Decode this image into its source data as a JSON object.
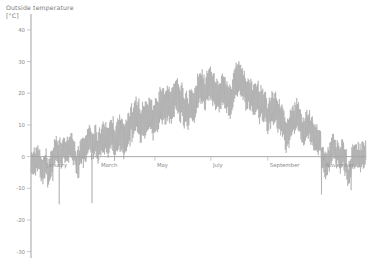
{
  "chart_data": {
    "type": "line",
    "title_line1": "Outside temperature",
    "title_line2": "[°C]",
    "xlabel": "",
    "ylabel": "Outside temperature [°C]",
    "ylim": [
      -30,
      45
    ],
    "yticks": [
      40,
      30,
      20,
      10,
      0,
      -10,
      -20,
      -30
    ],
    "ytick_labels": [
      "40",
      "30",
      "20",
      "10",
      "0",
      "-10",
      "-20",
      "-30"
    ],
    "xlim": [
      0,
      365
    ],
    "xticks": [
      15,
      74,
      135,
      196,
      258,
      319
    ],
    "xtick_labels": [
      "January",
      "March",
      "May",
      "July",
      "September",
      "November"
    ],
    "grid": false,
    "legend": null,
    "series_name": "Outside temperature",
    "series_color": "#9a9a9a",
    "axis_color": "#b0b0b0",
    "zero_line_value": 0,
    "sampling": "hourly over one calendar year",
    "annual_min": -26,
    "annual_max": 33,
    "monthly_mean": [
      -2,
      0,
      4,
      9,
      14,
      18,
      20,
      19,
      15,
      10,
      4,
      0
    ],
    "monthly_max": [
      8,
      10,
      16,
      23,
      28,
      31,
      33,
      32,
      28,
      22,
      14,
      10
    ],
    "monthly_min": [
      -18,
      -26,
      -12,
      -3,
      2,
      6,
      9,
      8,
      3,
      -2,
      -9,
      -16
    ],
    "x": [
      1,
      8,
      15,
      22,
      29,
      36,
      43,
      50,
      57,
      64,
      71,
      78,
      85,
      92,
      99,
      106,
      113,
      120,
      127,
      134,
      141,
      148,
      155,
      162,
      169,
      176,
      183,
      190,
      197,
      204,
      211,
      218,
      225,
      232,
      239,
      246,
      253,
      260,
      267,
      274,
      281,
      288,
      295,
      302,
      309,
      316,
      323,
      330,
      337,
      344,
      351,
      358,
      365
    ],
    "values": [
      -1,
      2,
      -3,
      -9,
      -14,
      -6,
      1,
      0,
      3,
      5,
      4,
      7,
      8,
      10,
      9,
      13,
      12,
      16,
      15,
      18,
      17,
      20,
      19,
      22,
      21,
      23,
      22,
      24,
      23,
      25,
      24,
      23,
      22,
      21,
      19,
      20,
      18,
      16,
      15,
      13,
      11,
      12,
      9,
      7,
      6,
      4,
      3,
      2,
      0,
      -2,
      1,
      3,
      2
    ]
  },
  "render": {
    "plot_left": 31,
    "plot_right": 366,
    "plot_top": 14,
    "plot_bottom": 258,
    "y_top_value": 45,
    "y_bottom_value": -32
  }
}
